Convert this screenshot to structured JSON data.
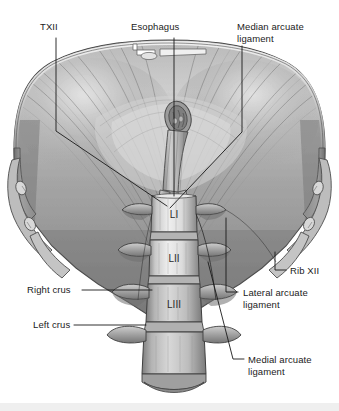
{
  "figure": {
    "background_color": "#ffffff",
    "text_color": "#1b1b1b",
    "leader_color": "#1a1a1a",
    "bottom_band_color": "#efefef",
    "width": 339,
    "height": 411
  },
  "labels": {
    "t12": "TXII",
    "esophagus": "Esophagus",
    "median_arcuate_line1": "Median arcuate",
    "median_arcuate_line2": "ligament",
    "rib12": "Rib XII",
    "lateral_arcuate_line1": "Lateral arcuate",
    "lateral_arcuate_line2": "ligament",
    "medial_arcuate_line1": "Medial arcuate",
    "medial_arcuate_line2": "ligament",
    "right_crus": "Right crus",
    "left_crus": "Left crus",
    "vertebra_l1": "LI",
    "vertebra_l2": "LII",
    "vertebra_l3": "LIII"
  },
  "anatomy": {
    "structures": [
      "diaphragm dome",
      "central tendon",
      "esophageal hiatus",
      "esophagus",
      "median arcuate ligament",
      "lateral arcuate ligament",
      "medial arcuate ligament",
      "right crus",
      "left crus",
      "lumbar vertebrae LI LII LIII",
      "rib XII",
      "T12 vertebra"
    ],
    "view": "inferior view"
  }
}
